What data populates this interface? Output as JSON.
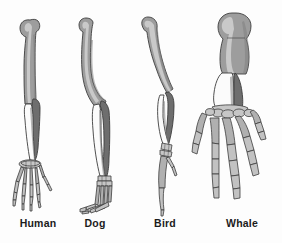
{
  "figure": {
    "background_color": "#fdfdfd",
    "label_color": "#1b1b1b"
  },
  "bone_colors": {
    "humerus": "#9d9d9d",
    "humerus_light": "#b4b4b4",
    "radius": "#fbfbfb",
    "ulna": "#6e6e6e",
    "carpals": "#c9c9c9",
    "digits": "#b0b0b0",
    "outline": "#3a3a3a"
  },
  "specimens": [
    {
      "id": "human",
      "label": "Human",
      "bones": [
        "humerus",
        "radius",
        "ulna",
        "carpals",
        "metacarpals",
        "phalanges"
      ],
      "digit_count": 5
    },
    {
      "id": "dog",
      "label": "Dog",
      "bones": [
        "humerus",
        "radius",
        "ulna",
        "carpals",
        "metacarpals",
        "phalanges"
      ],
      "digit_count": 4
    },
    {
      "id": "bird",
      "label": "Bird",
      "bones": [
        "humerus",
        "radius",
        "ulna",
        "carpals",
        "metacarpals",
        "phalanges"
      ],
      "digit_count": 3
    },
    {
      "id": "whale",
      "label": "Whale",
      "bones": [
        "humerus",
        "radius",
        "ulna",
        "carpals",
        "metacarpals",
        "phalanges"
      ],
      "digit_count": 5
    }
  ]
}
